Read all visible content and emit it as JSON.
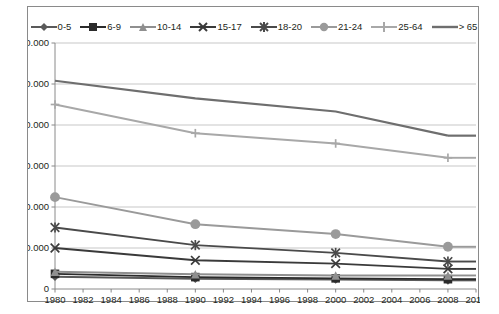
{
  "chart_data": {
    "type": "line",
    "title": "",
    "subtitle": "",
    "xlabel": "",
    "ylabel": "",
    "x": [
      1980,
      1990,
      2000,
      2008
    ],
    "xlim": [
      1980,
      2010
    ],
    "ylim": [
      0,
      60000
    ],
    "xtick_labels": [
      "1980",
      "1982",
      "1984",
      "1986",
      "1988",
      "1990",
      "1992",
      "1994",
      "1996",
      "1998",
      "2000",
      "2002",
      "2004",
      "2006",
      "2008",
      "2010"
    ],
    "xtick_values": [
      1980,
      1982,
      1984,
      1986,
      1988,
      1990,
      1992,
      1994,
      1996,
      1998,
      2000,
      2002,
      2004,
      2006,
      2008,
      2010
    ],
    "ytick_labels": [
      "0",
      "10.000",
      "20.000",
      "30.000",
      "40.000",
      "50.000",
      "60.000"
    ],
    "ytick_values": [
      0,
      10000,
      20000,
      30000,
      40000,
      50000,
      60000
    ],
    "grid": "horizontal",
    "legend_position": "top-center",
    "series": [
      {
        "name": "0-5",
        "marker": "diamond",
        "color": "#5a5a5a",
        "values": [
          3000,
          2500,
          2300,
          2100
        ]
      },
      {
        "name": "6-9",
        "marker": "square",
        "color": "#2b2b2b",
        "values": [
          3700,
          2900,
          2600,
          2400
        ]
      },
      {
        "name": "10-14",
        "marker": "triangle",
        "color": "#8f8f8f",
        "values": [
          4200,
          3600,
          3300,
          3300
        ]
      },
      {
        "name": "15-17",
        "marker": "cross",
        "color": "#3a3a3a",
        "values": [
          10000,
          7000,
          6200,
          4900
        ]
      },
      {
        "name": "18-20",
        "marker": "star",
        "color": "#4a4a4a",
        "values": [
          15000,
          10700,
          8800,
          6700
        ]
      },
      {
        "name": "21-24",
        "marker": "circle",
        "color": "#9a9a9a",
        "values": [
          22400,
          15800,
          13400,
          10300
        ]
      },
      {
        "name": "25-64",
        "marker": "plus",
        "color": "#a8a8a8",
        "values": [
          45000,
          38000,
          35500,
          32000
        ]
      },
      {
        "name": "> 65",
        "marker": "none",
        "color": "#6e6e6e",
        "values": [
          50800,
          46500,
          43300,
          37400
        ]
      }
    ]
  }
}
